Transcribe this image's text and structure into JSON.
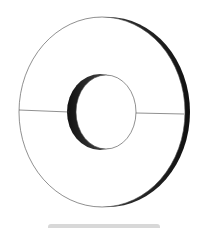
{
  "figure": {
    "colors": {
      "background": "#ffffff",
      "outline": "#333333",
      "shading_dark": "#1a1a1a",
      "bottom_bar": "#d8d8d8"
    }
  }
}
